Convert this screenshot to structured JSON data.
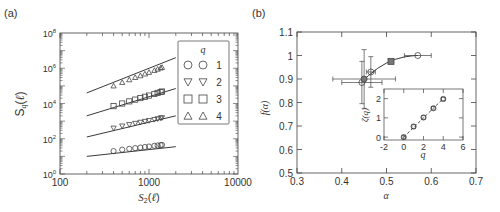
{
  "chart_data": [
    {
      "panel_label": "(a)",
      "type": "scatter",
      "xscale": "log",
      "yscale": "log",
      "xlabel": "S2(ℓ)",
      "ylabel": "Sq(ℓ)",
      "xlim": [
        100,
        10000
      ],
      "ylim": [
        1,
        100000000
      ],
      "xticks": [
        "100",
        "1000",
        "10000"
      ],
      "yticks": [
        "10^0",
        "10^2",
        "10^4",
        "10^6",
        "10^8"
      ],
      "grid": false,
      "legend": {
        "title": "q",
        "position": "upper right",
        "entries": [
          "1",
          "2",
          "3",
          "4"
        ]
      },
      "x": [
        400,
        500,
        600,
        700,
        800,
        900,
        1000,
        1150,
        1250,
        1350,
        1400
      ],
      "series": [
        {
          "name": "q=1",
          "marker": "circle",
          "log10_values": [
            1.3,
            1.38,
            1.43,
            1.47,
            1.5,
            1.53,
            1.56,
            1.6,
            1.62,
            1.64,
            1.65
          ],
          "fit_line": {
            "x": [
              200,
              2000
            ],
            "log10_y": [
              1.0,
              1.55
            ]
          }
        },
        {
          "name": "q=2",
          "marker": "triangle-down",
          "log10_values": [
            2.6,
            2.72,
            2.8,
            2.87,
            2.93,
            2.98,
            3.03,
            3.09,
            3.13,
            3.17,
            3.19
          ],
          "fit_line": {
            "x": [
              200,
              2000
            ],
            "log10_y": [
              2.1,
              3.3
            ]
          }
        },
        {
          "name": "q=3",
          "marker": "square",
          "log10_values": [
            3.85,
            4.0,
            4.12,
            4.22,
            4.31,
            4.38,
            4.45,
            4.54,
            4.6,
            4.65,
            4.68
          ],
          "fit_line": {
            "x": [
              200,
              2000
            ],
            "log10_y": [
              3.3,
              4.85
            ]
          }
        },
        {
          "name": "q=4",
          "marker": "triangle-up",
          "log10_values": [
            5.0,
            5.2,
            5.35,
            5.48,
            5.58,
            5.68,
            5.77,
            5.88,
            5.95,
            6.02,
            6.05
          ],
          "fit_line": {
            "x": [
              200,
              2000
            ],
            "log10_y": [
              4.6,
              6.6
            ]
          }
        }
      ]
    },
    {
      "panel_label": "(b)",
      "type": "scatter",
      "xlabel": "α",
      "ylabel": "f(α)",
      "xlim": [
        0.3,
        0.7
      ],
      "ylim": [
        0.5,
        1.1
      ],
      "xticks": [
        "0.3",
        "0.4",
        "0.5",
        "0.6",
        "0.7"
      ],
      "yticks": [
        "0.5",
        "0.6",
        "0.7",
        "0.8",
        "0.9",
        "1",
        "1.1"
      ],
      "grid": false,
      "points": [
        {
          "alpha": 0.445,
          "f": 0.885,
          "xerr": 0.045,
          "yerr": 0.09,
          "marker": "circle"
        },
        {
          "alpha": 0.45,
          "f": 0.9,
          "xerr": 0.07,
          "yerr": 0.125,
          "marker": "circle-filled"
        },
        {
          "alpha": 0.465,
          "f": 0.93,
          "xerr": 0.01,
          "yerr": 0.065,
          "marker": "circle"
        },
        {
          "alpha": 0.51,
          "f": 0.975,
          "xerr": 0.0,
          "yerr": 0.0,
          "marker": "square-filled"
        },
        {
          "alpha": 0.57,
          "f": 1.0,
          "xerr": 0.03,
          "yerr": 0.0,
          "marker": "circle"
        }
      ],
      "fit_curve": {
        "alpha": [
          0.445,
          0.46,
          0.48,
          0.5,
          0.52,
          0.54,
          0.56,
          0.57
        ],
        "f": [
          0.89,
          0.915,
          0.945,
          0.968,
          0.984,
          0.994,
          0.999,
          1.0
        ]
      },
      "inset": {
        "type": "scatter",
        "xlabel": "q",
        "ylabel": "ζ(q)",
        "xlim": [
          -2,
          6
        ],
        "ylim": [
          -0.15,
          2.5
        ],
        "xticks": [
          "-2",
          "0",
          "2",
          "4",
          "6"
        ],
        "yticks": [
          "0",
          "1",
          "2"
        ],
        "q": [
          0,
          1,
          2,
          3,
          4
        ],
        "zeta": [
          0.0,
          0.55,
          1.02,
          1.5,
          1.98
        ],
        "fit_line": {
          "q": [
            0,
            4
          ],
          "zeta": [
            0.0,
            2.0
          ]
        }
      }
    }
  ]
}
